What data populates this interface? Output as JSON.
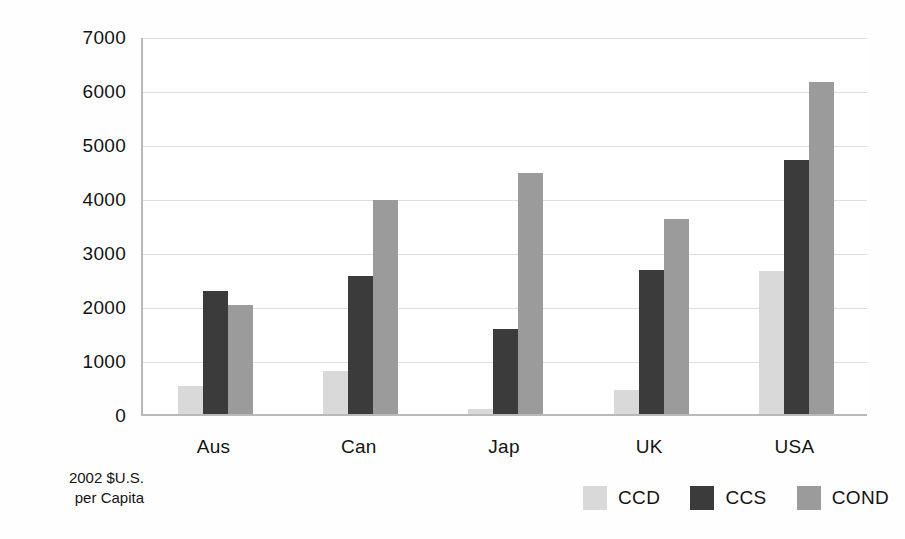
{
  "chart_data": {
    "type": "bar",
    "title": "",
    "subtitle": "",
    "xlabel": "",
    "ylabel": "2002 $U.S. per Capita",
    "ylabel_lines": [
      "2002 $U.S.",
      "per Capita"
    ],
    "categories": [
      "Aus",
      "Can",
      "Jap",
      "UK",
      "USA"
    ],
    "series": [
      {
        "name": "CCD",
        "color": "#d9d9d9",
        "values": [
          520,
          790,
          100,
          450,
          2640
        ]
      },
      {
        "name": "CCS",
        "color": "#3b3b3b",
        "values": [
          2280,
          2560,
          1570,
          2660,
          4700
        ]
      },
      {
        "name": "COND",
        "color": "#9b9b9b",
        "values": [
          2010,
          3960,
          4470,
          3610,
          6150
        ]
      }
    ],
    "ylim": [
      0,
      7000
    ],
    "yticks": [
      0,
      1000,
      2000,
      3000,
      4000,
      5000,
      6000,
      7000
    ],
    "ytick_labels": [
      "0",
      "1000",
      "2000",
      "3000",
      "4000",
      "5000",
      "6000",
      "7000"
    ],
    "grid": true,
    "grid_axis": "y",
    "legend_position": "bottom-right",
    "legend_entries": [
      "CCD",
      "CCS",
      "COND"
    ],
    "colors": {
      "ccd": "#d9d9d9",
      "ccs": "#3b3b3b",
      "cond": "#9b9b9b",
      "axis": "#b9b9b9",
      "grid": "#dfdfdf",
      "text": "#141414",
      "background": "#ffffff"
    }
  }
}
